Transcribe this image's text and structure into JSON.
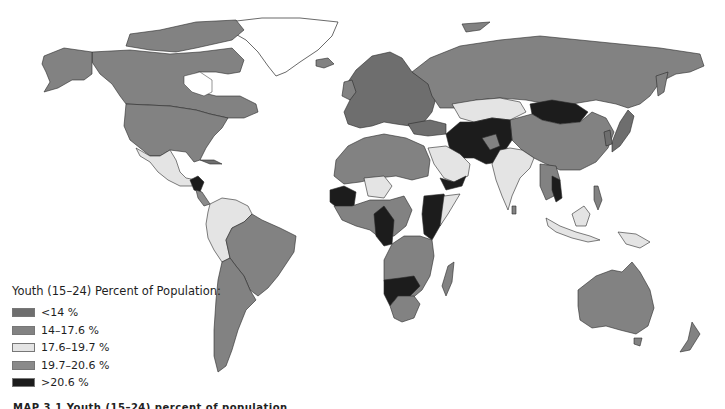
{
  "legend": {
    "title": "Youth (15–24) Percent of Population:",
    "items": [
      {
        "label": "<14 %",
        "color": "#6e6e6e"
      },
      {
        "label": "14–17.6 %",
        "color": "#828282"
      },
      {
        "label": "17.6–19.7 %",
        "color": "#e4e4e4"
      },
      {
        "label": "19.7–20.6 %",
        "color": "#8a8a8a"
      },
      {
        "label": ">20.6 %",
        "color": "#1c1c1c"
      }
    ]
  },
  "caption": "MAP 3.1 Youth (15–24) percent of population"
}
